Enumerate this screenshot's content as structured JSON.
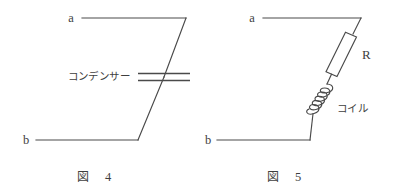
{
  "sheet": {
    "background_color": "#ffffff",
    "ink_color": "#4a4a4a",
    "text_color": "#3e3e3e"
  },
  "figures": [
    {
      "id": "fig-4",
      "caption_label": "図",
      "caption_number": "4",
      "terminals": {
        "top": "a",
        "bottom": "b"
      },
      "component": {
        "kind": "capacitor",
        "label": "コンデンサー"
      }
    },
    {
      "id": "fig-5",
      "caption_label": "図",
      "caption_number": "5",
      "terminals": {
        "top": "a",
        "bottom": "b"
      },
      "components": [
        {
          "kind": "resistor",
          "label": "R"
        },
        {
          "kind": "inductor",
          "label": "コイル"
        }
      ]
    }
  ]
}
